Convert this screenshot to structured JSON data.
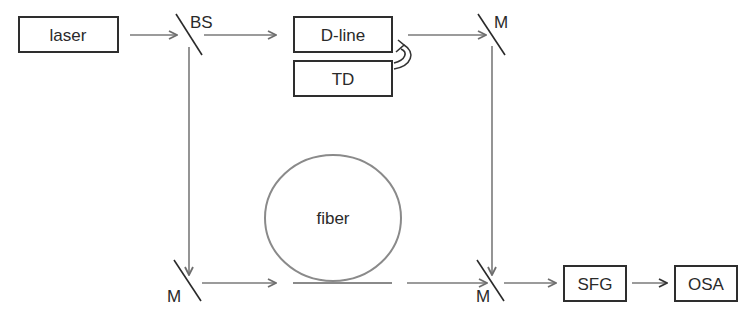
{
  "diagram": {
    "title": "",
    "components": {
      "laser": "laser",
      "beam_splitter": "BS",
      "delay_line": "D-line",
      "translation_driver": "TD",
      "mirror_top_right": "M",
      "mirror_bottom_left": "M",
      "mirror_bottom_right": "M",
      "fiber": "fiber",
      "sfg": "SFG",
      "osa": "OSA"
    },
    "connections": [
      {
        "from": "laser",
        "to": "BS"
      },
      {
        "from": "BS",
        "to": "D-line"
      },
      {
        "from": "D-line",
        "to": "M (top right)"
      },
      {
        "from": "M (top right)",
        "to": "M (bottom right)"
      },
      {
        "from": "BS",
        "to": "M (bottom left)"
      },
      {
        "from": "M (bottom left)",
        "to": "fiber"
      },
      {
        "from": "fiber",
        "to": "M (bottom right)"
      },
      {
        "from": "M (bottom right)",
        "to": "SFG"
      },
      {
        "from": "SFG",
        "to": "OSA"
      },
      {
        "from": "TD",
        "to": "D-line",
        "style": "curved-arrow"
      }
    ]
  }
}
